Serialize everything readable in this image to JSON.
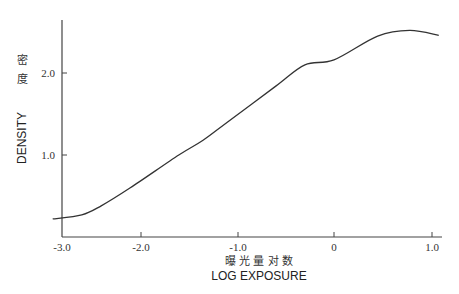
{
  "chart_data": {
    "type": "line",
    "title": "",
    "xlabel": "LOG EXPOSURE",
    "xlabel_cn": "曝 光 量 对 数",
    "ylabel": "DENSITY",
    "ylabel_cn": [
      "密",
      "度"
    ],
    "xlim": [
      -3.0,
      1.1
    ],
    "ylim": [
      0,
      2.65
    ],
    "x_ticks": [
      "-3.0",
      "-2.0",
      "-1.0",
      "0",
      "1.0"
    ],
    "y_ticks": [
      "1.0",
      "2.0"
    ],
    "grid": false,
    "legend": null,
    "series": [
      {
        "name": "characteristic curve",
        "x": [
          -2.9,
          -2.6,
          -2.4,
          -2.1,
          -1.6,
          -1.35,
          -1.1,
          -0.6,
          -0.3,
          0.0,
          0.45,
          0.78,
          1.08
        ],
        "values": [
          0.22,
          0.27,
          0.38,
          0.6,
          1.0,
          1.18,
          1.4,
          1.84,
          2.1,
          2.16,
          2.45,
          2.52,
          2.46
        ]
      }
    ]
  },
  "colors": {
    "axis": "#444444",
    "curve": "#333333",
    "text": "#333333"
  }
}
